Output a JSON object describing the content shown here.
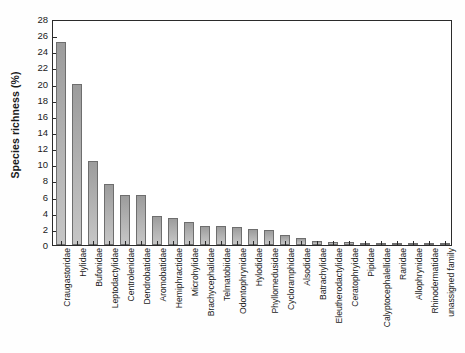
{
  "chart_data": {
    "type": "bar",
    "title": "",
    "xlabel": "",
    "ylabel": "Species richness (%)",
    "ylim": [
      0,
      28
    ],
    "ytick_step": 2,
    "yticks": [
      0,
      2,
      4,
      6,
      8,
      10,
      12,
      14,
      16,
      18,
      20,
      22,
      24,
      26,
      28
    ],
    "grid": false,
    "legend": "none",
    "bar_color": "#a8a8a8",
    "bar_edge_color": "#6e6e6e",
    "axis_color": "#2b2b2b",
    "categories": [
      "Craugastoridae",
      "Hylidae",
      "Bufonidae",
      "Leptodactylidae",
      "Centrolenidae",
      "Dendrobatidae",
      "Aromobatidae",
      "Hemiphractidae",
      "Microhylidae",
      "Brachycephalidae",
      "Telmatobiidae",
      "Odontophrynidae",
      "Hylodidae",
      "Phyllomedusidae",
      "Cycloramphidae",
      "Alsodidae",
      "Batrachylidae",
      "Eleutherodactylidae",
      "Ceratophryidae",
      "Pipidae",
      "Calyptocephalellidae",
      "Ranidae",
      "Allophrynidae",
      "Rhinodermatidae",
      "unassigned family"
    ],
    "values": [
      25.2,
      19.9,
      10.4,
      7.5,
      6.2,
      6.2,
      3.6,
      3.4,
      2.8,
      2.4,
      2.3,
      2.2,
      2.0,
      1.8,
      1.3,
      0.9,
      0.45,
      0.4,
      0.35,
      0.3,
      0.25,
      0.2,
      0.15,
      0.1,
      0.05
    ]
  }
}
